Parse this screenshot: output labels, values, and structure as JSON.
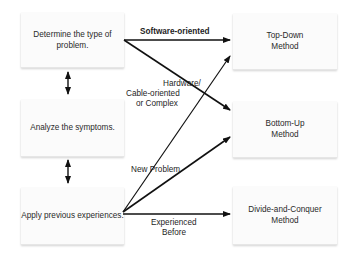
{
  "diagram": {
    "steps": [
      {
        "id": "determine",
        "label": "Determine the type of problem."
      },
      {
        "id": "analyze",
        "label": "Analyze the symptoms."
      },
      {
        "id": "apply",
        "label": "Apply previous experiences."
      }
    ],
    "methods": [
      {
        "id": "top-down",
        "label": "Top-Down Method"
      },
      {
        "id": "bottom-up",
        "label": "Bottom-Up Method"
      },
      {
        "id": "divide-conquer",
        "label": "Divide-and-Conquer Method"
      }
    ],
    "edge_labels": {
      "software": "Software-oriented",
      "hardware_line1": "Hardware/",
      "hardware_line2": "Cable-oriented",
      "hardware_line3": "or Complex",
      "new_problem": "New Problem",
      "experienced_line1": "Experienced",
      "experienced_line2": "Before"
    },
    "edges": [
      {
        "from": "determine",
        "to": "top-down",
        "label": "Software-oriented"
      },
      {
        "from": "determine",
        "to": "bottom-up",
        "label": "Hardware/ Cable-oriented or Complex"
      },
      {
        "from": "apply",
        "to": "top-down",
        "label": "New Problem"
      },
      {
        "from": "apply",
        "to": "bottom-up",
        "label": "New Problem"
      },
      {
        "from": "apply",
        "to": "divide-conquer",
        "label": "Experienced Before"
      },
      {
        "from": "determine",
        "to": "analyze",
        "label": "",
        "bidirectional": true
      },
      {
        "from": "analyze",
        "to": "apply",
        "label": "",
        "bidirectional": true
      }
    ],
    "colors": {
      "box_bg": "#fbfbfb",
      "line": "#111111",
      "text": "#2a2a2a"
    }
  }
}
